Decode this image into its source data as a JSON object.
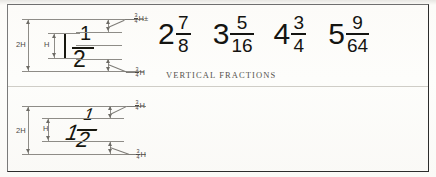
{
  "figure": {
    "background_color": "#fbfaf7",
    "ink_color": "#141411",
    "construction_line_color": "#8e8c87"
  },
  "sections": [
    {
      "id": "vertical",
      "caption": "VERTICAL FRACTIONS",
      "style": "vertical",
      "diagram": {
        "sample_numerator": "1",
        "sample_denominator": "2",
        "dimensions": [
          {
            "name": "overall-height",
            "label": "2H"
          },
          {
            "name": "digit-height",
            "label": "H"
          },
          {
            "name": "upper-gap",
            "numerator": "3",
            "denominator": "4",
            "suffix": "H±"
          },
          {
            "name": "lower-gap",
            "numerator": "3",
            "denominator": "4",
            "suffix": "H"
          }
        ]
      },
      "examples": [
        {
          "whole": "2",
          "numerator": "7",
          "denominator": "8"
        },
        {
          "whole": "3",
          "numerator": "5",
          "denominator": "16"
        },
        {
          "whole": "4",
          "numerator": "3",
          "denominator": "4"
        },
        {
          "whole": "5",
          "numerator": "9",
          "denominator": "64"
        }
      ]
    },
    {
      "id": "inclined",
      "caption": "INCLINED FRACTIONS",
      "style": "inclined",
      "diagram": {
        "sample_numerator": "1",
        "sample_denominator": "2",
        "dimensions": [
          {
            "name": "overall-height",
            "label": "2H"
          },
          {
            "name": "digit-height",
            "label": "H"
          },
          {
            "name": "upper-gap",
            "numerator": "3",
            "denominator": "4",
            "suffix": "H"
          },
          {
            "name": "lower-gap",
            "numerator": "3",
            "denominator": "4",
            "suffix": "H"
          }
        ]
      },
      "examples": [
        {
          "whole": "2",
          "numerator": "7",
          "denominator": "8"
        },
        {
          "whole": "3",
          "numerator": "5",
          "denominator": "16"
        },
        {
          "whole": "4",
          "numerator": "3",
          "denominator": "4"
        },
        {
          "whole": "5",
          "numerator": "9",
          "denominator": "64"
        }
      ]
    }
  ]
}
